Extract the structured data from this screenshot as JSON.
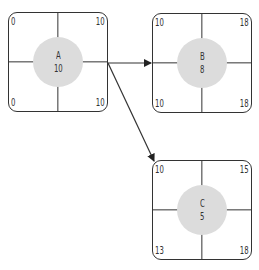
{
  "nodes": {
    "A": {
      "name": "A",
      "duration": "10",
      "es": "0",
      "ef": "10",
      "ls": "0",
      "lf": "10"
    },
    "B": {
      "name": "B",
      "duration": "8",
      "es": "10",
      "ef": "18",
      "ls": "10",
      "lf": "18"
    },
    "C": {
      "name": "C",
      "duration": "5",
      "es": "10",
      "ef": "15",
      "ls": "13",
      "lf": "18"
    }
  },
  "edges": [
    {
      "from": "A",
      "to": "B"
    },
    {
      "from": "A",
      "to": "C"
    }
  ],
  "colors": {
    "stroke": "#333333",
    "circle_fill": "#dcdcdc",
    "background": "#ffffff"
  }
}
